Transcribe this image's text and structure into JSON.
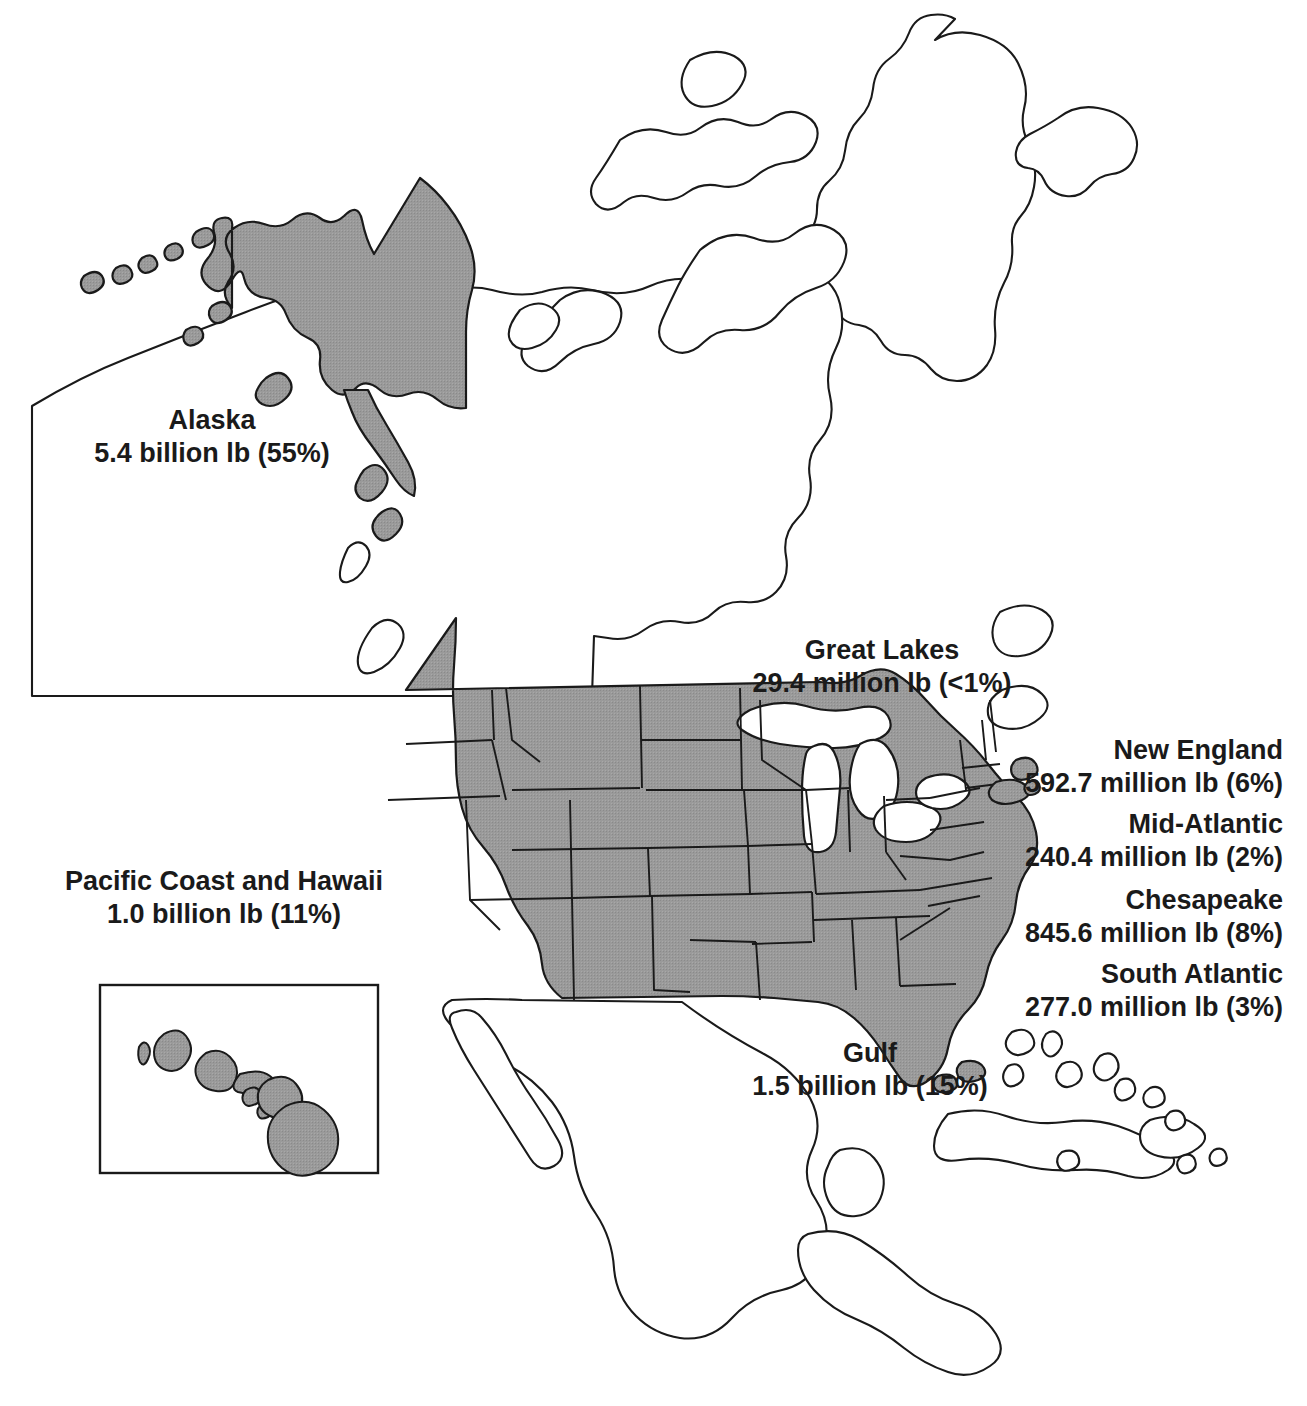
{
  "figure": {
    "type": "choropleth-locator-map",
    "region": "North America",
    "units": "pounds of commercial fishery landings",
    "fill_color": "#999999",
    "outline_color": "#1a1a1a",
    "background_color": "#ffffff"
  },
  "inset": {
    "name": "hawaii-inset",
    "label": "Hawaii"
  },
  "labels": [
    {
      "key": "alaska",
      "name": "Alaska",
      "value": "5.4 billion lb (55%)",
      "amount": 5.4,
      "amount_units": "billion lb",
      "percent": 55,
      "align": "center"
    },
    {
      "key": "pacific_coast_and_hawaii",
      "name": "Pacific Coast and Hawaii",
      "value": "1.0 billion lb (11%)",
      "amount": 1.0,
      "amount_units": "billion lb",
      "percent": 11,
      "align": "center"
    },
    {
      "key": "great_lakes",
      "name": "Great Lakes",
      "value": "29.4 million lb (<1%)",
      "amount": 29.4,
      "amount_units": "million lb",
      "percent": 0.3,
      "align": "center"
    },
    {
      "key": "gulf",
      "name": "Gulf",
      "value": "1.5 billion lb (15%)",
      "amount": 1.5,
      "amount_units": "billion lb",
      "percent": 15,
      "align": "center"
    },
    {
      "key": "new_england",
      "name": "New England",
      "value": "592.7 million lb (6%)",
      "amount": 592.7,
      "amount_units": "million lb",
      "percent": 6,
      "align": "right"
    },
    {
      "key": "mid_atlantic",
      "name": "Mid-Atlantic",
      "value": "240.4 million lb (2%)",
      "amount": 240.4,
      "amount_units": "million lb",
      "percent": 2,
      "align": "right"
    },
    {
      "key": "chesapeake",
      "name": "Chesapeake",
      "value": "845.6 million lb (8%)",
      "amount": 845.6,
      "amount_units": "million lb",
      "percent": 8,
      "align": "right"
    },
    {
      "key": "south_atlantic",
      "name": "South Atlantic",
      "value": "277.0 million lb (3%)",
      "amount": 277.0,
      "amount_units": "million lb",
      "percent": 3,
      "align": "right"
    }
  ]
}
